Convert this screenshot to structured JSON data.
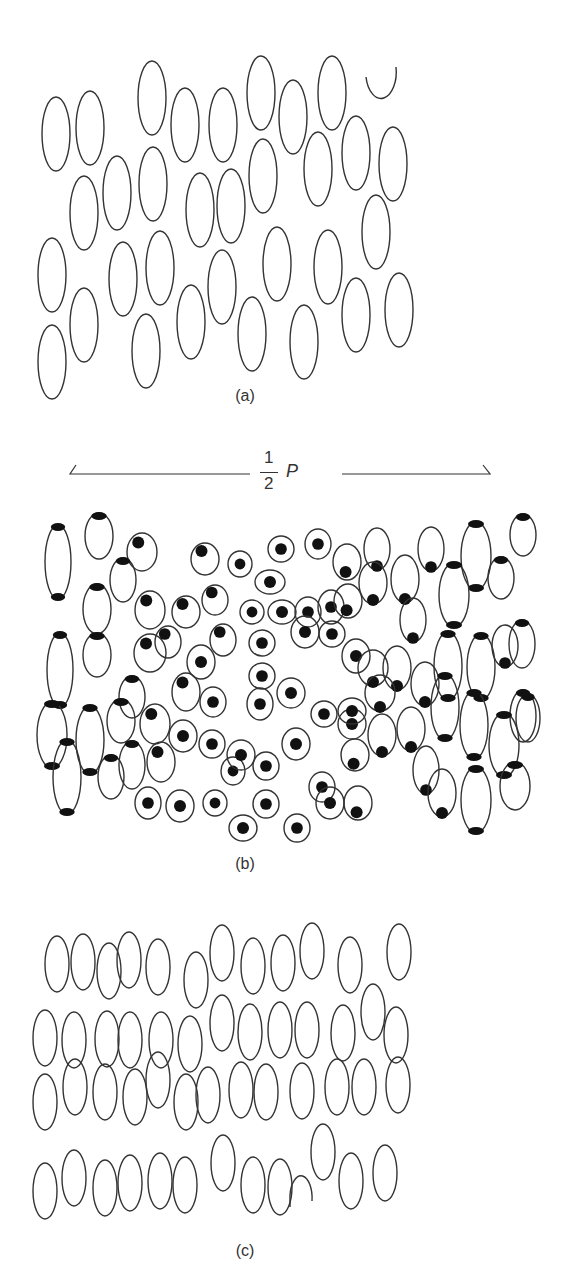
{
  "figure": {
    "panels": [
      {
        "id": "a",
        "label": "(a)",
        "label_pos": [
          245,
          396
        ]
      },
      {
        "id": "b",
        "label": "(b)",
        "label_pos": [
          245,
          864
        ]
      },
      {
        "id": "c",
        "label": "(c)",
        "label_pos": [
          245,
          1251
        ]
      }
    ],
    "dimension": {
      "numerator": "1",
      "denominator": "2",
      "symbol": "P",
      "left_line": [
        70,
        250
      ],
      "right_line": [
        342,
        490
      ],
      "y": 474
    },
    "colors": {
      "stroke": "#333333",
      "fill": "#111111",
      "background": "#ffffff"
    }
  },
  "panel_a": {
    "ellipses": [
      [
        56,
        134
      ],
      [
        90,
        128
      ],
      [
        152,
        98
      ],
      [
        185,
        125
      ],
      [
        223,
        125
      ],
      [
        261,
        93
      ],
      [
        293,
        117
      ],
      [
        332,
        93
      ],
      [
        84,
        213
      ],
      [
        117,
        193
      ],
      [
        153,
        184
      ],
      [
        200,
        210
      ],
      [
        231,
        206
      ],
      [
        263,
        176
      ],
      [
        318,
        169
      ],
      [
        356,
        153
      ],
      [
        393,
        164
      ],
      [
        376,
        232
      ],
      [
        52,
        275
      ],
      [
        123,
        279
      ],
      [
        160,
        268
      ],
      [
        222,
        287
      ],
      [
        277,
        264
      ],
      [
        328,
        267
      ],
      [
        84,
        325
      ],
      [
        52,
        362
      ],
      [
        146,
        351
      ],
      [
        191,
        322
      ],
      [
        252,
        334
      ],
      [
        304,
        342
      ],
      [
        356,
        315
      ],
      [
        399,
        310
      ]
    ],
    "arc": [
      381,
      87
    ]
  },
  "panel_b": {
    "cells": [
      [
        58,
        562,
        13,
        37,
        "tb"
      ],
      [
        99,
        536,
        14,
        23,
        "t"
      ],
      [
        142,
        552,
        15,
        19,
        "tl"
      ],
      [
        205,
        559,
        14,
        16,
        "tl"
      ],
      [
        240,
        564,
        12,
        13,
        "c"
      ],
      [
        281,
        549,
        13,
        13,
        "c"
      ],
      [
        318,
        544,
        13,
        15,
        "c"
      ],
      [
        347,
        562,
        14,
        18,
        "bl"
      ],
      [
        377,
        549,
        13,
        21,
        "b"
      ],
      [
        405,
        579,
        14,
        24,
        "b"
      ],
      [
        431,
        549,
        13,
        22,
        "b"
      ],
      [
        476,
        556,
        15,
        34,
        "tb"
      ],
      [
        523,
        535,
        13,
        21,
        "t"
      ],
      [
        97,
        609,
        14,
        25,
        "t"
      ],
      [
        123,
        580,
        13,
        22,
        "t"
      ],
      [
        150,
        610,
        15,
        19,
        "tl"
      ],
      [
        186,
        612,
        14,
        16,
        "tl"
      ],
      [
        215,
        600,
        13,
        15,
        "tl"
      ],
      [
        252,
        612,
        12,
        12,
        "c"
      ],
      [
        270,
        582,
        15,
        12,
        "c"
      ],
      [
        282,
        612,
        14,
        12,
        "c"
      ],
      [
        308,
        612,
        13,
        15,
        "c"
      ],
      [
        331,
        607,
        13,
        17,
        "c"
      ],
      [
        348,
        601,
        14,
        17,
        "bl"
      ],
      [
        373,
        583,
        14,
        21,
        "b"
      ],
      [
        413,
        620,
        13,
        22,
        "b"
      ],
      [
        454,
        595,
        15,
        32,
        "tb"
      ],
      [
        501,
        578,
        13,
        21,
        "t"
      ],
      [
        522,
        644,
        13,
        24,
        "t"
      ],
      [
        60,
        670,
        13,
        37,
        "tb"
      ],
      [
        97,
        655,
        14,
        22,
        "t"
      ],
      [
        132,
        697,
        13,
        21,
        "t"
      ],
      [
        150,
        653,
        16,
        19,
        "tl"
      ],
      [
        168,
        642,
        13,
        16,
        "tl"
      ],
      [
        201,
        662,
        14,
        17,
        "c"
      ],
      [
        223,
        640,
        13,
        16,
        "tl"
      ],
      [
        262,
        643,
        13,
        13,
        "c"
      ],
      [
        262,
        676,
        13,
        13,
        "c"
      ],
      [
        305,
        632,
        14,
        16,
        "c"
      ],
      [
        332,
        634,
        13,
        13,
        "c"
      ],
      [
        356,
        656,
        14,
        17,
        "c"
      ],
      [
        373,
        668,
        15,
        18,
        "b"
      ],
      [
        397,
        668,
        14,
        22,
        "b"
      ],
      [
        425,
        684,
        14,
        22,
        "b"
      ],
      [
        448,
        666,
        14,
        34,
        "tb"
      ],
      [
        481,
        667,
        14,
        33,
        "tb"
      ],
      [
        505,
        646,
        13,
        21,
        "b"
      ],
      [
        523,
        716,
        13,
        26,
        "t"
      ],
      [
        52,
        735,
        15,
        33,
        "tb"
      ],
      [
        90,
        740,
        14,
        34,
        "tb"
      ],
      [
        121,
        721,
        14,
        22,
        "t"
      ],
      [
        155,
        724,
        15,
        20,
        "tl"
      ],
      [
        186,
        692,
        14,
        19,
        "tl"
      ],
      [
        213,
        702,
        13,
        15,
        "c"
      ],
      [
        260,
        704,
        13,
        16,
        "c"
      ],
      [
        291,
        693,
        14,
        15,
        "c"
      ],
      [
        324,
        714,
        13,
        13,
        "c"
      ],
      [
        352,
        724,
        14,
        15,
        "c"
      ],
      [
        352,
        711,
        14,
        13,
        "c"
      ],
      [
        380,
        693,
        15,
        18,
        "b"
      ],
      [
        411,
        729,
        14,
        22,
        "b"
      ],
      [
        445,
        707,
        14,
        33,
        "tb"
      ],
      [
        474,
        725,
        14,
        34,
        "tb"
      ],
      [
        504,
        745,
        15,
        32,
        "tb"
      ],
      [
        528,
        718,
        12,
        24,
        "t"
      ],
      [
        67,
        777,
        14,
        37,
        "tb"
      ],
      [
        111,
        777,
        13,
        22,
        "t"
      ],
      [
        132,
        765,
        13,
        24,
        "t"
      ],
      [
        161,
        762,
        14,
        20,
        "tl"
      ],
      [
        183,
        736,
        14,
        16,
        "c"
      ],
      [
        212,
        744,
        13,
        14,
        "c"
      ],
      [
        233,
        771,
        12,
        14,
        "c"
      ],
      [
        241,
        755,
        14,
        15,
        "c"
      ],
      [
        266,
        766,
        13,
        14,
        "c"
      ],
      [
        296,
        744,
        14,
        16,
        "c"
      ],
      [
        322,
        787,
        13,
        15,
        "c"
      ],
      [
        355,
        755,
        14,
        16,
        "bl"
      ],
      [
        382,
        735,
        14,
        21,
        "b"
      ],
      [
        426,
        770,
        13,
        24,
        "b"
      ],
      [
        442,
        793,
        14,
        24,
        "b"
      ],
      [
        476,
        800,
        15,
        33,
        "tb"
      ],
      [
        515,
        786,
        15,
        24,
        "t"
      ],
      [
        148,
        803,
        13,
        16,
        "c"
      ],
      [
        180,
        806,
        14,
        16,
        "c"
      ],
      [
        215,
        803,
        12,
        13,
        "c"
      ],
      [
        243,
        828,
        14,
        13,
        "c"
      ],
      [
        266,
        804,
        13,
        14,
        "c"
      ],
      [
        297,
        828,
        13,
        14,
        "c"
      ],
      [
        330,
        803,
        14,
        16,
        "c"
      ],
      [
        358,
        803,
        14,
        17,
        "bl"
      ]
    ]
  },
  "panel_c": {
    "ellipses": [
      [
        57,
        964
      ],
      [
        83,
        962
      ],
      [
        109,
        971
      ],
      [
        129,
        960
      ],
      [
        158,
        967
      ],
      [
        196,
        980
      ],
      [
        222,
        953
      ],
      [
        253,
        966
      ],
      [
        283,
        963
      ],
      [
        312,
        951
      ],
      [
        350,
        965
      ],
      [
        399,
        952
      ],
      [
        45,
        1038
      ],
      [
        74,
        1040
      ],
      [
        107,
        1039
      ],
      [
        130,
        1040
      ],
      [
        161,
        1040
      ],
      [
        190,
        1044
      ],
      [
        222,
        1023
      ],
      [
        250,
        1032
      ],
      [
        280,
        1030
      ],
      [
        307,
        1030
      ],
      [
        343,
        1033
      ],
      [
        373,
        1012
      ],
      [
        396,
        1035
      ],
      [
        45,
        1102
      ],
      [
        75,
        1087
      ],
      [
        105,
        1092
      ],
      [
        135,
        1097
      ],
      [
        158,
        1080
      ],
      [
        186,
        1102
      ],
      [
        208,
        1095
      ],
      [
        241,
        1090
      ],
      [
        266,
        1092
      ],
      [
        302,
        1091
      ],
      [
        337,
        1087
      ],
      [
        364,
        1087
      ],
      [
        398,
        1085
      ],
      [
        45,
        1191
      ],
      [
        74,
        1178
      ],
      [
        105,
        1188
      ],
      [
        130,
        1183
      ],
      [
        160,
        1181
      ],
      [
        185,
        1185
      ],
      [
        223,
        1163
      ],
      [
        253,
        1185
      ],
      [
        280,
        1187
      ],
      [
        323,
        1152
      ],
      [
        351,
        1181
      ],
      [
        385,
        1173
      ]
    ],
    "arc": [
      301,
      1195
    ]
  }
}
